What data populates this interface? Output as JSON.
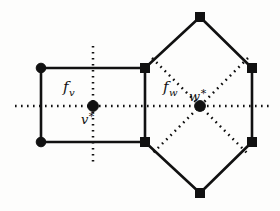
{
  "figure": {
    "width": 280,
    "height": 211,
    "background_color": "#fdfdfc",
    "ink_color": "#111111"
  },
  "labels": {
    "face_v": {
      "base": "f",
      "sub": "v",
      "full": "f_v"
    },
    "face_w": {
      "base": "f",
      "sub": "w",
      "full": "f_w"
    },
    "center_v": {
      "base": "v",
      "star": "*",
      "full": "v*"
    },
    "center_w": {
      "base": "w",
      "star": "*",
      "full": "w*"
    }
  },
  "geometry": {
    "rectangle_face": {
      "name": "f_v",
      "vertex_marker": "circle",
      "vertices": [
        {
          "x": 41,
          "y": 68
        },
        {
          "x": 145,
          "y": 68
        },
        {
          "x": 145,
          "y": 142
        },
        {
          "x": 41,
          "y": 142
        }
      ],
      "center": {
        "x": 93,
        "y": 106
      }
    },
    "hexagon_face": {
      "name": "f_w",
      "vertex_marker": "square",
      "vertices": [
        {
          "x": 200,
          "y": 17
        },
        {
          "x": 252,
          "y": 68
        },
        {
          "x": 252,
          "y": 142
        },
        {
          "x": 200,
          "y": 193
        },
        {
          "x": 145,
          "y": 142
        },
        {
          "x": 145,
          "y": 68
        }
      ],
      "center": {
        "x": 200,
        "y": 106
      }
    },
    "circle_vertices": [
      {
        "x": 41,
        "y": 68,
        "r": 4.6
      },
      {
        "x": 41,
        "y": 142,
        "r": 4.6
      }
    ],
    "square_vertices": [
      {
        "x": 145,
        "y": 68,
        "size": 9
      },
      {
        "x": 145,
        "y": 142,
        "size": 9
      },
      {
        "x": 200,
        "y": 17,
        "size": 9
      },
      {
        "x": 252,
        "y": 68,
        "size": 9
      },
      {
        "x": 252,
        "y": 142,
        "size": 9
      },
      {
        "x": 200,
        "y": 193,
        "size": 9
      }
    ],
    "center_dots": [
      {
        "name": "v-star",
        "x": 93,
        "y": 106,
        "r": 5.2
      },
      {
        "name": "w-star",
        "x": 200,
        "y": 106,
        "r": 5.2
      }
    ],
    "dotted_axes": [
      {
        "name": "horizontal-axis",
        "x1": 15,
        "y1": 106,
        "x2": 270,
        "y2": 106
      },
      {
        "name": "vertical-axis-v",
        "x1": 93,
        "y1": 46,
        "x2": 93,
        "y2": 165
      },
      {
        "name": "diagonal-axis-nw-se",
        "x1": 152,
        "y1": 58,
        "x2": 248,
        "y2": 154
      },
      {
        "name": "diagonal-axis-ne-sw",
        "x1": 248,
        "y1": 58,
        "x2": 152,
        "y2": 154
      }
    ]
  },
  "label_positions": {
    "face_v": {
      "x": 63,
      "y": 90
    },
    "face_w": {
      "x": 163,
      "y": 90
    },
    "center_v": {
      "x": 82,
      "y": 122
    },
    "center_w": {
      "x": 190,
      "y": 100
    }
  }
}
